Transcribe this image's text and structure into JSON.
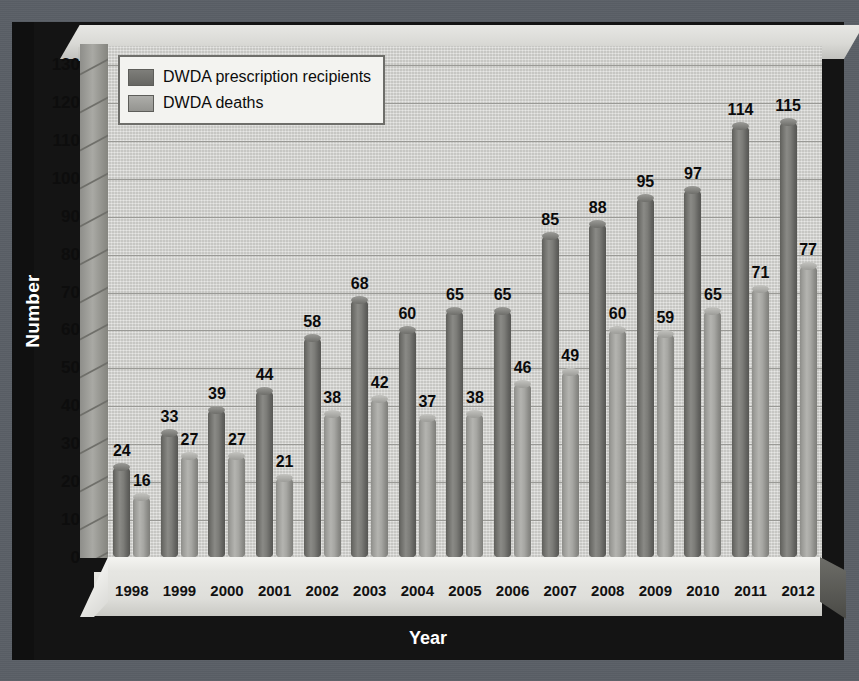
{
  "chart_data": {
    "type": "bar",
    "title": "",
    "xlabel": "Year",
    "ylabel": "Number",
    "ylim": [
      0,
      135
    ],
    "yticks": [
      0,
      10,
      20,
      30,
      40,
      50,
      60,
      70,
      80,
      90,
      100,
      110,
      120,
      130
    ],
    "grid": true,
    "legend_position": "top-left",
    "categories": [
      "1998",
      "1999",
      "2000",
      "2001",
      "2002",
      "2003",
      "2004",
      "2005",
      "2006",
      "2007",
      "2008",
      "2009",
      "2010",
      "2011",
      "2012"
    ],
    "series": [
      {
        "name": "DWDA prescription recipients",
        "color": "#7e7e7a",
        "values": [
          24,
          33,
          39,
          44,
          58,
          68,
          60,
          65,
          65,
          85,
          88,
          95,
          97,
          114,
          115
        ]
      },
      {
        "name": "DWDA deaths",
        "color": "#adada9",
        "values": [
          16,
          27,
          27,
          21,
          38,
          42,
          37,
          38,
          46,
          49,
          60,
          59,
          65,
          71,
          77
        ]
      }
    ]
  },
  "legend": {
    "items": [
      {
        "label": "DWDA prescription recipients"
      },
      {
        "label": "DWDA deaths"
      }
    ]
  },
  "axes": {
    "y_title": "Number",
    "x_title": "Year"
  }
}
